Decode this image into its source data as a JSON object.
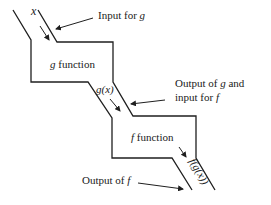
{
  "diagram": {
    "type": "function composition machine",
    "input_symbol": "x",
    "g_box": {
      "name": "g",
      "label": "function"
    },
    "f_box": {
      "name": "f",
      "label": "function"
    },
    "intermediate_symbol": "g(x)",
    "output_symbol": "f(g(x))",
    "annotations": {
      "input_for_g": {
        "prefix": "Input for ",
        "var": "g"
      },
      "output_g_line1": {
        "prefix": "Output of ",
        "var": "g",
        "suffix": " and"
      },
      "output_g_line2": {
        "prefix": "input for ",
        "var": "f"
      },
      "output_of_f": {
        "prefix": "Output of ",
        "var": "f"
      }
    }
  }
}
